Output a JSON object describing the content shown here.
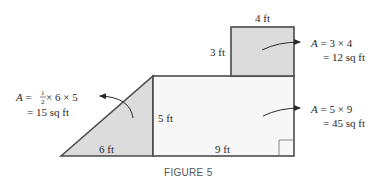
{
  "figure": {
    "caption": "FIGURE 5",
    "colors": {
      "stroke": "#4a4a4a",
      "shaded_fill": "#dcdcdc",
      "rect_fill": "#f7f7f7",
      "text": "#2a2a2a"
    },
    "square": {
      "top_label": "4 ft",
      "side_label": "3 ft",
      "formula_var": "A",
      "formula_line1": " = 3 × 4",
      "formula_line2": "= 12 sq ft"
    },
    "rectangle": {
      "side_label": "5 ft",
      "bottom_label": "9 ft",
      "formula_var": "A",
      "formula_line1": " = 5 × 9",
      "formula_line2": "= 45 sq ft"
    },
    "triangle": {
      "bottom_label": "6 ft",
      "formula_var": "A",
      "formula_eq": " = ",
      "frac_num": "1",
      "frac_den": "2",
      "formula_rest": " × 6 × 5",
      "formula_line2": "= 15 sq ft"
    }
  }
}
